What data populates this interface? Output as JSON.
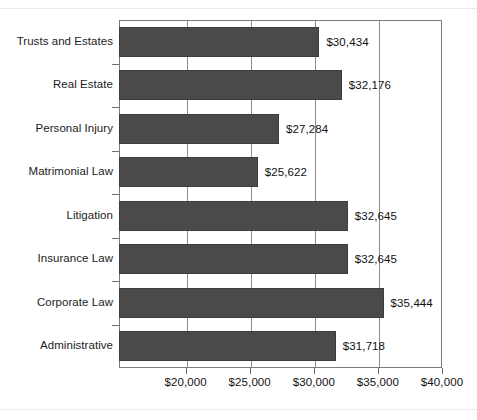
{
  "chart_data": {
    "type": "bar",
    "orientation": "horizontal",
    "title": "",
    "xlabel": "",
    "ylabel": "",
    "categories": [
      "Trusts and Estates",
      "Real Estate",
      "Personal Injury",
      "Matrimonial Law",
      "Litigation",
      "Insurance Law",
      "Corporate Law",
      "Administrative"
    ],
    "values": [
      30434,
      32176,
      27284,
      25622,
      32645,
      32645,
      35444,
      31718
    ],
    "value_labels": [
      "$30,434",
      "$32,176",
      "$27,284",
      "$25,622",
      "$32,645",
      "$32,645",
      "$35,444",
      "$31,718"
    ],
    "xticks": [
      20000,
      25000,
      30000,
      35000,
      40000
    ],
    "xtick_labels": [
      "$20,000",
      "$25,000",
      "$30,000",
      "$35,000",
      "$40,000"
    ],
    "xlim": [
      14800,
      40000
    ],
    "grid": true,
    "legend": false,
    "bar_color": "#4a4a4a",
    "axis_color": "#7a7a7a",
    "grid_color": "#8d8d8d",
    "label_color": "#111111"
  }
}
